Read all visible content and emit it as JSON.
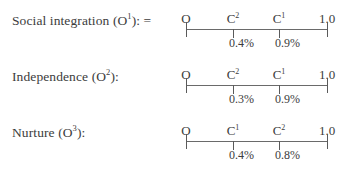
{
  "rows": [
    {
      "label_main": "Social integration (O",
      "label_sup": "1",
      "label_tail": "): =",
      "scale": {
        "start": "O",
        "end": "1.0",
        "points": [
          {
            "letter": "C",
            "sup": "2",
            "value": "0.4%"
          },
          {
            "letter": "C",
            "sup": "1",
            "value": "0.9%"
          }
        ]
      }
    },
    {
      "label_main": "Independence (O",
      "label_sup": "2",
      "label_tail": "):",
      "scale": {
        "start": "O",
        "end": "1.0",
        "points": [
          {
            "letter": "C",
            "sup": "2",
            "value": "0.3%"
          },
          {
            "letter": "C",
            "sup": "1",
            "value": "0.9%"
          }
        ]
      }
    },
    {
      "label_main": "Nurture (O",
      "label_sup": "3",
      "label_tail": "):",
      "scale": {
        "start": "O",
        "end": "1.0",
        "points": [
          {
            "letter": "C",
            "sup": "1",
            "value": "0.4%"
          },
          {
            "letter": "C",
            "sup": "2",
            "value": "0.8%"
          }
        ]
      }
    }
  ]
}
